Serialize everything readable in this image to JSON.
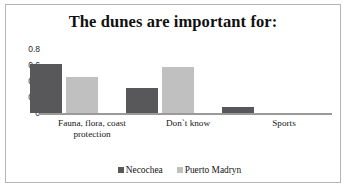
{
  "chart_data": {
    "type": "bar",
    "title": "The dunes are important for:",
    "xlabel": "",
    "ylabel": "",
    "ylim": [
      0,
      0.8
    ],
    "grid": false,
    "legend_position": "bottom",
    "categories": [
      "Fauna, flora, coast protection",
      "Don`t  know",
      "Sports"
    ],
    "category_lines": [
      [
        "Fauna, flora, coast",
        "protection"
      ],
      [
        "Don`t  know"
      ],
      [
        "Sports"
      ]
    ],
    "ytick_labels": [
      "0.8",
      "0.6",
      "0.4",
      "0.2",
      "0"
    ],
    "ytick_values": [
      0.8,
      0.6,
      0.4,
      0.2,
      0
    ],
    "series": [
      {
        "name": "Necochea",
        "color": "#58585a",
        "values": [
          0.61,
          0.31,
          0.07
        ]
      },
      {
        "name": "Puerto Madryn",
        "color": "#c0c0c0",
        "values": [
          0.45,
          0.57,
          0.0
        ]
      }
    ]
  },
  "legend": {
    "items": [
      {
        "label": "Necochea",
        "color": "#58585a"
      },
      {
        "label": "Puerto Madryn",
        "color": "#c0c0c0"
      }
    ]
  }
}
